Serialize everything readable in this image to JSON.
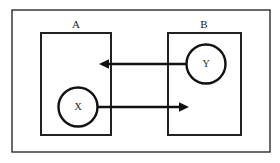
{
  "diagram": {
    "title": "",
    "canvas": {
      "width": 280,
      "height": 163,
      "background": "#ffffff"
    },
    "frame": {
      "name": "outer-frame",
      "x": 12,
      "y": 10,
      "width": 258,
      "height": 142,
      "stroke": "#2b2b2b"
    },
    "groups": [
      {
        "id": "A",
        "label": "A",
        "label_x": 76,
        "label_y": 25,
        "x": 41,
        "y": 33,
        "width": 70,
        "height": 102,
        "stroke": "#222222"
      },
      {
        "id": "B",
        "label": "B",
        "label_x": 204,
        "label_y": 25,
        "x": 168,
        "y": 33,
        "width": 73,
        "height": 102,
        "stroke": "#222222"
      }
    ],
    "nodes": [
      {
        "id": "X",
        "label": "X",
        "group": "A",
        "cx": 78,
        "cy": 107,
        "r": 19.5,
        "stroke": "#111111",
        "fill": "#ffffff"
      },
      {
        "id": "Y",
        "label": "Y",
        "group": "B",
        "cx": 206,
        "cy": 64,
        "r": 19.5,
        "stroke": "#111111",
        "fill": "#ffffff"
      }
    ],
    "edges": [
      {
        "id": "edge-y-to-a",
        "from": "Y",
        "to": "A",
        "direction": "left",
        "x1": 186.5,
        "y1": 64,
        "x2": 99,
        "y2": 64,
        "stroke": "#111111"
      },
      {
        "id": "edge-x-to-b",
        "from": "X",
        "to": "B",
        "direction": "right",
        "x1": 97.5,
        "y1": 107,
        "x2": 189,
        "y2": 107,
        "stroke": "#111111"
      }
    ]
  }
}
